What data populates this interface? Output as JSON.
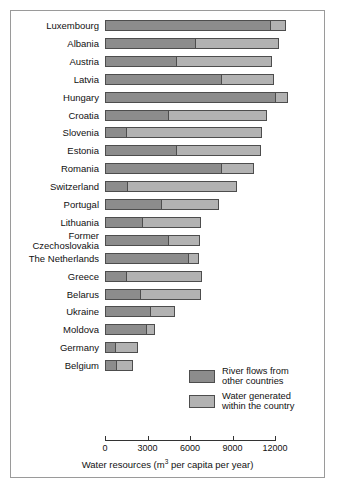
{
  "chart_data": {
    "type": "bar",
    "orientation": "horizontal",
    "stacked": true,
    "title": "",
    "xlabel": "Water resources (m3 per capita per year)",
    "xlabel_parts": {
      "pre": "Water resources (m",
      "sup": "3",
      "post": " per capita per year)"
    },
    "ylabel": "",
    "xlim": [
      0,
      12800
    ],
    "xticks": [
      0,
      3000,
      6000,
      9000,
      12000
    ],
    "xtick_labels": [
      "0",
      "3000",
      "6000",
      "9000",
      "12000"
    ],
    "grid": false,
    "legend_position": "inside-lower-right",
    "categories": [
      "Luxembourg",
      "Albania",
      "Austria",
      "Latvia",
      "Hungary",
      "Croatia",
      "Slovenia",
      "Estonia",
      "Romania",
      "Switzerland",
      "Portugal",
      "Lithuania",
      "Former\nCzechoslovakia",
      "The Netherlands",
      "Greece",
      "Belarus",
      "Ukraine",
      "Moldova",
      "Germany",
      "Belgium"
    ],
    "series": [
      {
        "name": "River flows from other countries",
        "color": "#8c8c8c",
        "values": [
          11800,
          6400,
          5100,
          8300,
          12100,
          4500,
          1500,
          5100,
          8300,
          1600,
          4050,
          2650,
          4550,
          6000,
          1500,
          2500,
          3250,
          3000,
          750,
          800
        ]
      },
      {
        "name": "Water generated within the country",
        "color": "#b2b2b2",
        "values": [
          1000,
          5900,
          6700,
          3600,
          800,
          6900,
          9600,
          5900,
          2250,
          7750,
          4000,
          4150,
          2150,
          600,
          5350,
          4250,
          1700,
          550,
          1600,
          1200
        ]
      }
    ],
    "totals": [
      12800,
      12300,
      11800,
      11900,
      12900,
      11400,
      11100,
      11000,
      10550,
      9350,
      8050,
      6800,
      6700,
      6600,
      6850,
      6750,
      4950,
      3550,
      2350,
      2000
    ]
  },
  "legend": {
    "entries": [
      {
        "label": "River flows from\nother countries",
        "color": "#8c8c8c"
      },
      {
        "label": "Water generated\nwithin the country",
        "color": "#b2b2b2"
      }
    ]
  }
}
